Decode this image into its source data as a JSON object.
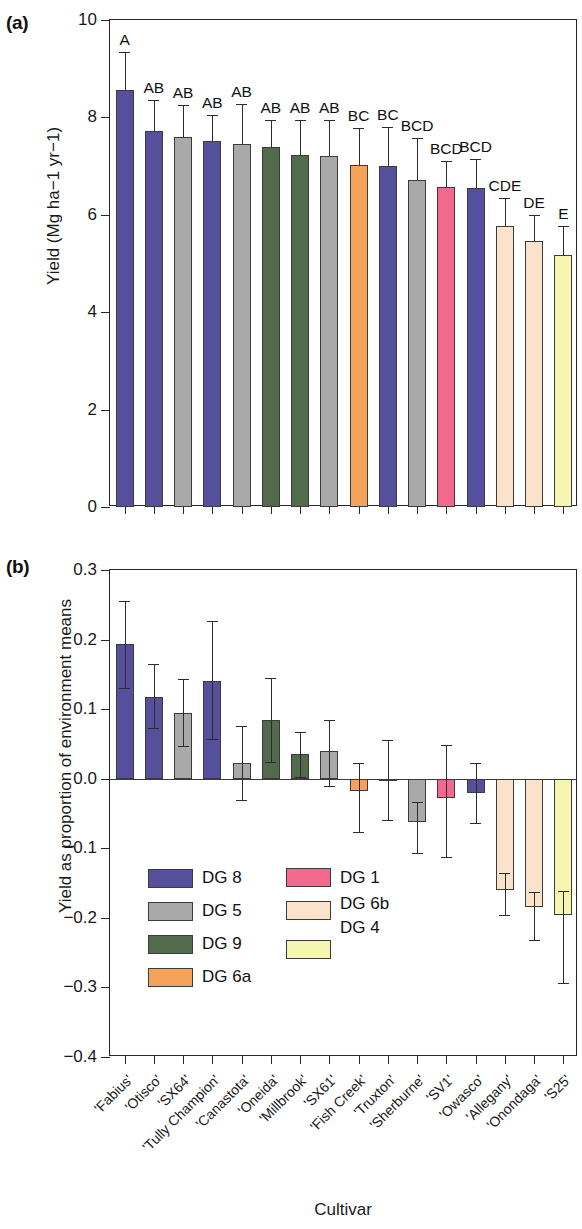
{
  "figure": {
    "panel_a_tag": "(a)",
    "panel_b_tag": "(b)",
    "xlabel": "Cultivar"
  },
  "chart_data": [
    {
      "type": "bar",
      "panel": "(a)",
      "title": "",
      "xlabel": "Cultivar",
      "ylabel": "Yield (Mg ha−1 yr−1)",
      "ylim": [
        0,
        10
      ],
      "yticks": [
        0,
        2,
        4,
        6,
        8,
        10
      ],
      "ytick_labels": [
        "0",
        "2",
        "4",
        "6",
        "8",
        "10"
      ],
      "grid": false,
      "categories": [
        "'Fabius'",
        "'Otisco'",
        "'SX64'",
        "'Tully Champion'",
        "'Canastota'",
        "'Oneida'",
        "'Millbrook'",
        "'SX61'",
        "'Fish Creek'",
        "'Truxton'",
        "'Sherburne'",
        "'SV1'",
        "'Owasco'",
        "'Allegany'",
        "'Onondaga'",
        "'S25'"
      ],
      "values": [
        8.57,
        7.72,
        7.6,
        7.52,
        7.46,
        7.4,
        7.22,
        7.2,
        7.02,
        7.0,
        6.72,
        6.58,
        6.55,
        5.78,
        5.47,
        5.18
      ],
      "err_upper": [
        9.35,
        8.35,
        8.25,
        8.05,
        8.28,
        7.95,
        7.95,
        7.95,
        7.78,
        7.8,
        7.58,
        7.1,
        7.15,
        6.35,
        6.0,
        5.78
      ],
      "err_lower": [
        8.57,
        7.72,
        7.6,
        7.52,
        7.46,
        7.4,
        7.22,
        7.2,
        7.02,
        7.0,
        6.72,
        6.58,
        6.55,
        5.78,
        5.47,
        5.18
      ],
      "significance_letters": [
        "A",
        "AB",
        "AB",
        "AB",
        "AB",
        "AB",
        "AB",
        "AB",
        "BC",
        "BC",
        "BCD",
        "BCD",
        "BCD",
        "CDE",
        "DE",
        "E"
      ],
      "group_keys": [
        "DG 8",
        "DG 8",
        "DG 5",
        "DG 8",
        "DG 5",
        "DG 9",
        "DG 9",
        "DG 5",
        "DG 6a",
        "DG 8",
        "DG 5",
        "DG 1",
        "DG 8",
        "DG 6b",
        "DG 6b",
        "DG 4"
      ]
    },
    {
      "type": "bar",
      "panel": "(b)",
      "title": "",
      "xlabel": "Cultivar",
      "ylabel": "Yield as proportion of environment means",
      "ylim": [
        -0.4,
        0.3
      ],
      "yticks": [
        -0.4,
        -0.3,
        -0.2,
        -0.1,
        0.0,
        0.1,
        0.2,
        0.3
      ],
      "ytick_labels": [
        "−0.4",
        "−0.3",
        "−0.2",
        "−0.1",
        "0.0",
        "0.1",
        "0.2",
        "0.3"
      ],
      "grid": false,
      "categories": [
        "'Fabius'",
        "'Otisco'",
        "'SX64'",
        "'Tully Champion'",
        "'Canastota'",
        "'Oneida'",
        "'Millbrook'",
        "'SX61'",
        "'Fish Creek'",
        "'Truxton'",
        "'Sherburne'",
        "'SV1'",
        "'Owasco'",
        "'Allegany'",
        "'Onondaga'",
        "'S25'"
      ],
      "values": [
        0.194,
        0.118,
        0.094,
        0.141,
        0.023,
        0.084,
        0.035,
        0.04,
        -0.018,
        -0.003,
        -0.062,
        -0.028,
        -0.02,
        -0.16,
        -0.185,
        -0.196
      ],
      "err_upper": [
        0.256,
        0.165,
        0.143,
        0.227,
        0.076,
        0.145,
        0.067,
        0.085,
        0.023,
        0.055,
        -0.034,
        0.049,
        0.023,
        -0.135,
        -0.163,
        -0.162
      ],
      "err_lower": [
        0.131,
        0.073,
        0.047,
        0.057,
        -0.031,
        0.024,
        0.002,
        -0.01,
        -0.076,
        -0.059,
        -0.107,
        -0.112,
        -0.064,
        -0.196,
        -0.232,
        -0.293
      ],
      "group_keys": [
        "DG 8",
        "DG 8",
        "DG 5",
        "DG 8",
        "DG 5",
        "DG 9",
        "DG 9",
        "DG 5",
        "DG 6a",
        "DG 8",
        "DG 5",
        "DG 1",
        "DG 8",
        "DG 6b",
        "DG 6b",
        "DG 4"
      ]
    }
  ],
  "legend": {
    "entries": [
      {
        "label": "DG 8",
        "color": "#56509c"
      },
      {
        "label": "DG 5",
        "color": "#a9a9a9"
      },
      {
        "label": "DG 9",
        "color": "#536b4d"
      },
      {
        "label": "DG 6a",
        "color": "#f5a35b"
      },
      {
        "label": "DG 1",
        "color": "#f2698d"
      },
      {
        "label": "DG 6b",
        "color": "#fae2cb"
      },
      {
        "label": "DG 4",
        "color": "#f6f6b0"
      }
    ]
  },
  "colors": {
    "DG 8": "#56509c",
    "DG 5": "#a9a9a9",
    "DG 9": "#536b4d",
    "DG 6a": "#f5a35b",
    "DG 1": "#f2698d",
    "DG 6b": "#fae2cb",
    "DG 4": "#f6f6b0",
    "axis": "#262626",
    "outline": "#3b3b3b"
  }
}
